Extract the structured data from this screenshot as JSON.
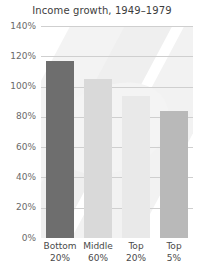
{
  "chart_data": {
    "type": "bar",
    "title": "Income growth, 1949–1979",
    "xlabel": "",
    "ylabel": "",
    "ylim": [
      0,
      140
    ],
    "ytick_values": [
      0,
      20,
      40,
      60,
      80,
      100,
      120,
      140
    ],
    "ytick_labels": [
      "0%",
      "20%",
      "40%",
      "60%",
      "80%",
      "100%",
      "120%",
      "140%"
    ],
    "grid": true,
    "legend": "none",
    "categories": [
      "Bottom 20%",
      "Middle 60%",
      "Top 20%",
      "Top 5%"
    ],
    "category_lines": [
      {
        "line1": "Bottom",
        "line2": "20%"
      },
      {
        "line1": "Middle",
        "line2": "60%"
      },
      {
        "line1": "Top",
        "line2": "20%"
      },
      {
        "line1": "Top",
        "line2": "5%"
      }
    ],
    "values": [
      117,
      105,
      94,
      84
    ],
    "value_labels": [
      "117%",
      "105%",
      "94%",
      "84%"
    ],
    "bar_colors": [
      "#6e6e6e",
      "#d9d9d9",
      "#e9e9e9",
      "#b9b9b9"
    ]
  },
  "axis_colors": {
    "grid": "#cfcfcf",
    "baseline": "#8a8a8a",
    "tick_text": "#6a6a6a",
    "title_text": "#3d3d3d"
  }
}
